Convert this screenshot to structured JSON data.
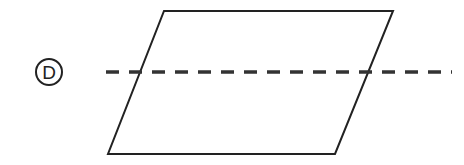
{
  "diagram": {
    "label": "D",
    "shape": "parallelogram",
    "vertices": [
      [
        164,
        11
      ],
      [
        393,
        11
      ],
      [
        335,
        154
      ],
      [
        108,
        154
      ]
    ],
    "fold_line": {
      "style": "dashed",
      "y": 72,
      "x_start": 106,
      "x_end": 452
    },
    "colors": {
      "stroke": "#222222",
      "dash": "#333333",
      "background": "#ffffff"
    }
  }
}
